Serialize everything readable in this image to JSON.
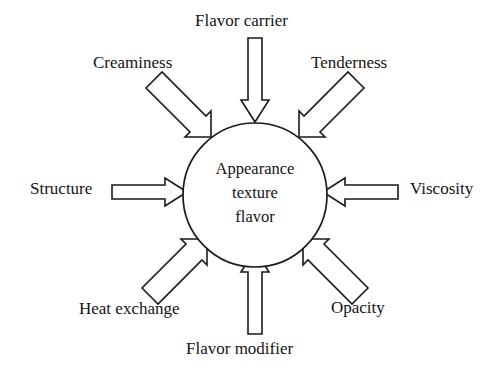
{
  "diagram": {
    "type": "radial-influence-diagram",
    "background_color": "#ffffff",
    "line_color": "#1a1a1a",
    "text_color": "#141414",
    "hub": {
      "shape": "circle",
      "lines": [
        "Appearance",
        "texture",
        "flavor"
      ],
      "line1": "Appearance",
      "line2": "texture",
      "line3": "flavor"
    },
    "nodes": [
      {
        "id": "flavor-carrier",
        "label": "Flavor carrier",
        "direction": "down",
        "position": "top"
      },
      {
        "id": "creaminess",
        "label": "Creaminess",
        "direction": "down-right",
        "position": "top-left"
      },
      {
        "id": "tenderness",
        "label": "Tenderness",
        "direction": "down-left",
        "position": "top-right"
      },
      {
        "id": "structure",
        "label": "Structure",
        "direction": "right",
        "position": "left"
      },
      {
        "id": "viscosity",
        "label": "Viscosity",
        "direction": "left",
        "position": "right"
      },
      {
        "id": "heat-exchange",
        "label": "Heat exchange",
        "direction": "up-right",
        "position": "bottom-left"
      },
      {
        "id": "opacity",
        "label": "Opacity",
        "direction": "up-left",
        "position": "bottom-right"
      },
      {
        "id": "flavor-modifier",
        "label": "Flavor modifier",
        "direction": "up",
        "position": "bottom"
      }
    ]
  }
}
